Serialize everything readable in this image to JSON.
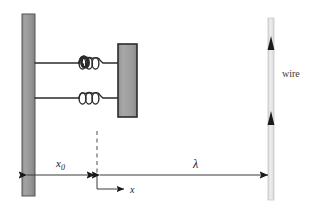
{
  "figure": {
    "labels": {
      "x_zero": "x",
      "x_zero_sub": "0",
      "x_axis": "x",
      "lambda": "λ",
      "wire": "wire"
    },
    "colors": {
      "wall_fill": "#949494",
      "wall_stroke": "#4a4a4a",
      "block_fill": "#9a9a9a",
      "block_stroke": "#2b2b2b",
      "spring_stroke": "#2b2b2b",
      "line_stroke": "#3a3a3a",
      "wire_fill": "#e2e2e2",
      "wire_stroke": "#c4c4c4",
      "arrow_fill": "#1a1a1a",
      "background": "#ffffff",
      "dash_stroke": "#4a4a4a",
      "text": "#1a1a1a"
    },
    "geometry": {
      "wall": {
        "x": 22,
        "y": 14,
        "width": 13,
        "height": 182
      },
      "block": {
        "x": 118,
        "y": 44,
        "width": 19,
        "height": 73
      },
      "springs": [
        {
          "y": 63,
          "coils": 4
        },
        {
          "y": 98,
          "coils": 4
        }
      ],
      "dashed_line": {
        "x": 97,
        "y_top": 131,
        "y_bottom": 177
      },
      "dim_x0": {
        "y": 175,
        "x_start": 26,
        "x_end": 96
      },
      "dim_lambda": {
        "y": 175,
        "x_start": 99,
        "x_end": 272
      },
      "x_axis_arrow": {
        "y": 189,
        "x_start": 97,
        "x_end": 128
      },
      "wire": {
        "x": 268,
        "y_top": 18,
        "width": 6,
        "height": 182
      },
      "wire_arrowheads_y": [
        43,
        118
      ]
    }
  }
}
